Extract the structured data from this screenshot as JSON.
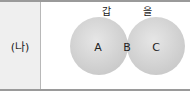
{
  "row_label": "(나)",
  "diagram": {
    "sets": [
      {
        "name": "갑",
        "region": "A"
      },
      {
        "name": "을",
        "region": "C"
      }
    ],
    "intersection_region": "B",
    "colors": {
      "circle_fill": "#d4d4d4",
      "circle_edge": "#bcbcbc",
      "overlap_fill": "#a9a9a9"
    }
  }
}
